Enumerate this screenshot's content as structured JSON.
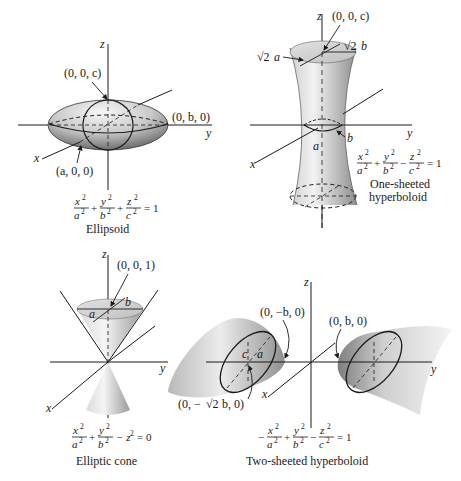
{
  "figure": {
    "panels": [
      {
        "id": "ellipsoid",
        "caption": "Ellipsoid",
        "equation": {
          "terms": [
            {
              "sign": "",
              "num": "x",
              "den": "a"
            },
            {
              "sign": "+",
              "num": "y",
              "den": "b"
            },
            {
              "sign": "+",
              "num": "z",
              "den": "c"
            }
          ],
          "rhs": "= 1"
        },
        "axes": {
          "x": "x",
          "y": "y",
          "z": "z"
        },
        "points": {
          "top": "(0, 0, c)",
          "side": "(0, b, 0)",
          "front": "(a, 0, 0)"
        }
      },
      {
        "id": "one-sheeted-hyperboloid",
        "caption_line1": "One-sheeted",
        "caption_line2": "hyperboloid",
        "equation": {
          "terms": [
            {
              "sign": "",
              "num": "x",
              "den": "a"
            },
            {
              "sign": "+",
              "num": "y",
              "den": "b"
            },
            {
              "sign": "−",
              "num": "z",
              "den": "c"
            }
          ],
          "rhs": "= 1"
        },
        "axes": {
          "x": "x",
          "y": "y",
          "z": "z"
        },
        "points": {
          "top": "(0, 0, c)",
          "top_a_radical": "√2",
          "top_a_var": "a",
          "top_b_radical": "√2",
          "top_b_var": "b",
          "waist_a": "a",
          "waist_b": "b"
        }
      },
      {
        "id": "elliptic-cone",
        "caption": "Elliptic cone",
        "equation": {
          "terms": [
            {
              "sign": "",
              "num": "x",
              "den": "a"
            },
            {
              "sign": "+",
              "num": "y",
              "den": "b"
            }
          ],
          "tail": "− z",
          "rhs": "= 0"
        },
        "axes": {
          "x": "x",
          "y": "y",
          "z": "z"
        },
        "points": {
          "top": "(0, 0, 1)",
          "a": "a",
          "b": "b"
        }
      },
      {
        "id": "two-sheeted-hyperboloid",
        "caption": "Two-sheeted hyperboloid",
        "equation": {
          "terms": [
            {
              "sign": "−",
              "num": "x",
              "den": "a"
            },
            {
              "sign": "+",
              "num": "y",
              "den": "b"
            },
            {
              "sign": "−",
              "num": "z",
              "den": "c"
            }
          ],
          "rhs": "= 1"
        },
        "axes": {
          "x": "x",
          "y": "y",
          "z": "z"
        },
        "points": {
          "neg_vertex": "(0, −b, 0)",
          "pos_vertex": "(0, b, 0)",
          "neg_trace_pre": "(0, −",
          "neg_trace_rad": "√2",
          "neg_trace_post": "b, 0)",
          "c": "c",
          "a": "a"
        }
      }
    ],
    "colors": {
      "ink": "#1a1a1a",
      "surface_light": "#f2f2f2",
      "surface_mid": "#c8c8c8",
      "surface_dark": "#8a8a8a"
    }
  }
}
